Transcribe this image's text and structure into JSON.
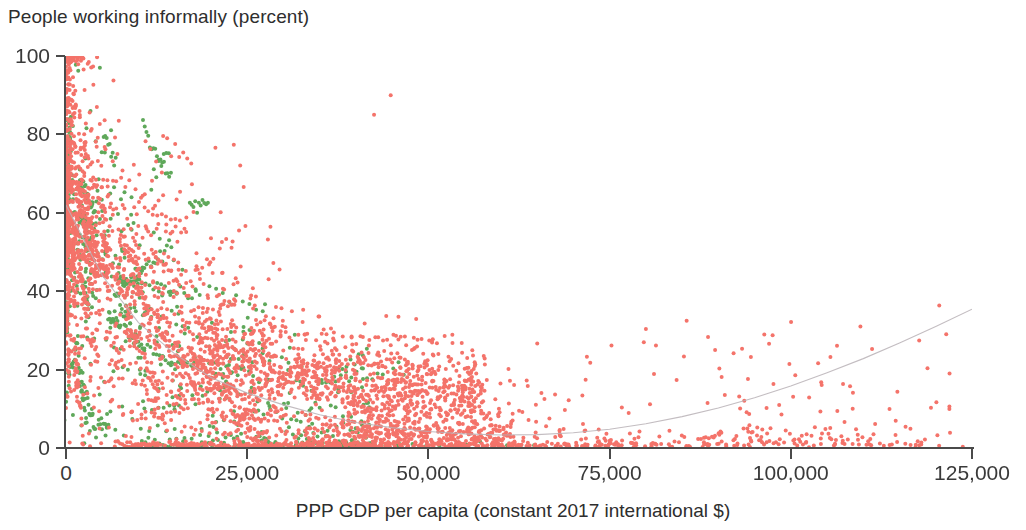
{
  "chart_data": {
    "type": "scatter",
    "title": "People working informally (percent)",
    "xlabel": "PPP GDP per capita (constant 2017 international $)",
    "ylabel": "People working informally (percent)",
    "xlim": [
      0,
      125000
    ],
    "ylim": [
      0,
      100
    ],
    "xticks": [
      0,
      25000,
      50000,
      75000,
      100000,
      125000
    ],
    "xticklabels": [
      "0",
      "25,000",
      "50,000",
      "75,000",
      "100,000",
      "125,000"
    ],
    "yticks": [
      0,
      20,
      40,
      60,
      80,
      100
    ],
    "yticklabels": [
      "0",
      "20",
      "40",
      "60",
      "80",
      "100"
    ],
    "grid": false,
    "legend": "none",
    "series": [
      {
        "name": "series-red",
        "color": "#F4736A",
        "marker": "circle",
        "marker_size": 4,
        "point_count": 2600,
        "description": "Dominant salmon-red cloud: dense mass at low GDP spanning the full 0-100 percent range, thinning to a low flat band near 0-20 percent beyond 50,000."
      },
      {
        "name": "series-green",
        "color": "#5FA85A",
        "marker": "circle",
        "marker_size": 4,
        "point_count": 520,
        "description": "Green cloud confined to GDP below about 45,000, concentrated between 10 and 90 percent informality."
      }
    ],
    "fit_curve": {
      "name": "fitted-trend",
      "color": "#B9B2B6",
      "style": "thin",
      "points": [
        [
          0,
          62
        ],
        [
          5000,
          44
        ],
        [
          10000,
          32
        ],
        [
          15000,
          24
        ],
        [
          20000,
          18
        ],
        [
          25000,
          14
        ],
        [
          30000,
          11
        ],
        [
          35000,
          8.5
        ],
        [
          40000,
          6.5
        ],
        [
          45000,
          5.2
        ],
        [
          50000,
          4.2
        ],
        [
          55000,
          3.6
        ],
        [
          60000,
          3.3
        ],
        [
          65000,
          3.4
        ],
        [
          70000,
          3.9
        ],
        [
          75000,
          4.8
        ],
        [
          80000,
          6.2
        ],
        [
          85000,
          8.0
        ],
        [
          90000,
          10.2
        ],
        [
          95000,
          12.8
        ],
        [
          100000,
          15.8
        ],
        [
          105000,
          19.2
        ],
        [
          110000,
          22.8
        ],
        [
          115000,
          26.8
        ],
        [
          120000,
          31.0
        ],
        [
          125000,
          35.4
        ]
      ]
    },
    "outliers": [
      {
        "x": 42500,
        "y": 85,
        "color": "#F4736A"
      },
      {
        "x": 44800,
        "y": 90,
        "color": "#F4736A"
      }
    ]
  }
}
